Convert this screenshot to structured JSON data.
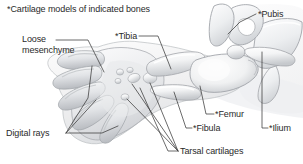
{
  "figure": {
    "title": "*Cartilage models of indicated bones",
    "background_color": "#ffffff",
    "text_color": "#2a2a2a",
    "leader_line_color": "#3a3a3a",
    "cartilage_fill": "#e3e4e6",
    "cartilage_highlight": "#fbfbfc",
    "cartilage_shadow": "#b9bbbe",
    "mesenchyme_fill": "#f1f1f2",
    "outline_color": "#9a9da1"
  },
  "labels": [
    {
      "id": "title",
      "text": "*Cartilage models of indicated bones"
    },
    {
      "id": "loose_mesenchyme",
      "line1": "Loose",
      "line2": "mesenchyme"
    },
    {
      "id": "tibia",
      "text": "*Tibia"
    },
    {
      "id": "pubis",
      "text": "*Pubis"
    },
    {
      "id": "femur",
      "text": "*Femur"
    },
    {
      "id": "ilium",
      "text": "*Ilium"
    },
    {
      "id": "fibula",
      "text": "*Fibula"
    },
    {
      "id": "digital_rays",
      "text": "Digital rays"
    },
    {
      "id": "tarsal_cartilages",
      "text": "Tarsal cartilages"
    }
  ]
}
